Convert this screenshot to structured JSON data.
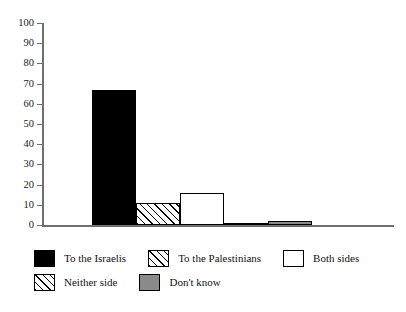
{
  "figure": {
    "title_sliver": "",
    "background": "#ffffff"
  },
  "chart_data": {
    "type": "bar",
    "title": "",
    "xlabel": "",
    "ylabel": "",
    "ylim": [
      0,
      100
    ],
    "yticks": [
      0,
      10,
      20,
      30,
      40,
      50,
      60,
      70,
      80,
      90,
      100
    ],
    "ytick_labels": [
      "0",
      "10",
      "20",
      "30",
      "40",
      "50",
      "60",
      "70",
      "80",
      "90",
      "100"
    ],
    "xtick_labels": [],
    "grid": false,
    "legend_position": "below",
    "categories": [
      "To the Israelis",
      "To the Palestinians",
      "Both sides",
      "Neither side",
      "Don't know"
    ],
    "values": [
      67,
      11,
      16,
      1,
      2
    ],
    "bar_styles": [
      "solid-black",
      "diagonal-hatch",
      "white",
      "diagonal-hatch",
      "solid-gray"
    ],
    "colors": {
      "to_the_israelis": "#000000",
      "to_the_palestinians": "#ffffff",
      "both_sides": "#ffffff",
      "neither_side": "#ffffff",
      "dont_know": "#8a8a8a",
      "axis": "#6f6f6f",
      "outline": "#000000"
    }
  },
  "legend": {
    "rows": [
      [
        {
          "label": "To the Israelis",
          "style": "solid-black"
        },
        {
          "label": "To the Palestinians",
          "style": "diagonal-hatch"
        },
        {
          "label": "Both sides",
          "style": "white"
        }
      ],
      [
        {
          "label": "Neither side",
          "style": "diagonal-hatch"
        },
        {
          "label": "Don't know",
          "style": "solid-gray"
        }
      ]
    ]
  }
}
